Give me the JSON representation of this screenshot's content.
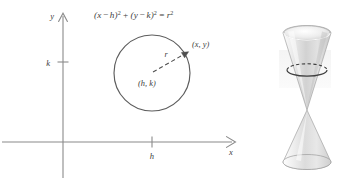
{
  "figure": {
    "background_color": "#ffffff",
    "ink_color": "#555555",
    "text_color": "#3d3d3d"
  },
  "equation": {
    "full": "(x − h)² + (y − k)² = r²",
    "open_paren_1": "(",
    "var_x": "x",
    "minus_1": "−",
    "var_h": "h",
    "close_paren_1": ")",
    "exp_1": "2",
    "plus": "+",
    "open_paren_2": "(",
    "var_y": "y",
    "minus_2": "−",
    "var_k": "k",
    "close_paren_2": ")",
    "exp_2": "2",
    "equals": "=",
    "var_r": "r",
    "exp_3": "2"
  },
  "axes": {
    "y_axis_label": "y",
    "x_axis_label": "x",
    "y_tick_label": "k",
    "x_tick_label": "h",
    "origin_x": 63,
    "origin_y": 142
  },
  "circle": {
    "center_label": "(h, k)",
    "point_label": "(x, y)",
    "radius_label": "r",
    "center_x": 152,
    "center_y": 73,
    "radius": 38,
    "point_on_circle_x": 188,
    "point_on_circle_y": 52
  },
  "cone": {
    "name": "double-cone",
    "description": "Double-napped cone with a horizontal circular cross-section near the top",
    "cross_section_label": "circle cross-section",
    "fill_light": "#fbfbfb",
    "fill_mid": "#d8d8d8",
    "fill_dark": "#b9b9b9",
    "outline_color": "#9a9a9a",
    "cross_section_color": "#4a4a4a"
  }
}
